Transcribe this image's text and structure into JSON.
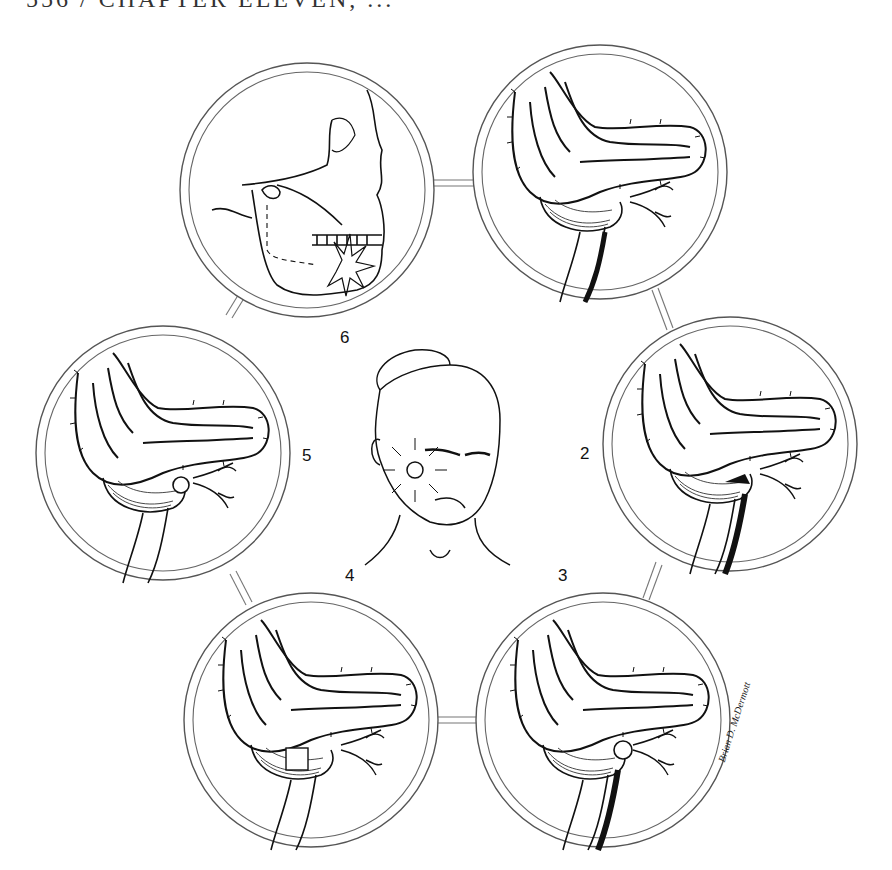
{
  "header": {
    "text": "556 / CHAPTER ELEVEN, ..."
  },
  "figure": {
    "center_panel": {
      "label": "",
      "subject": "face-with-facial-injury"
    },
    "panels": [
      {
        "number": "1",
        "label": "",
        "subject": "brainstem-cerebellum-stage-1"
      },
      {
        "number": "2",
        "label": "2",
        "subject": "brainstem-cerebellum-stage-2"
      },
      {
        "number": "3",
        "label": "3",
        "subject": "brainstem-cerebellum-stage-3"
      },
      {
        "number": "4",
        "label": "4",
        "subject": "brainstem-cerebellum-stage-4"
      },
      {
        "number": "5",
        "label": "5",
        "subject": "brainstem-cerebellum-stage-5"
      },
      {
        "number": "6",
        "label": "6",
        "subject": "skull-mandible-fracture"
      }
    ],
    "signature": "Brian D. McDermott"
  },
  "colors": {
    "line": "#222222",
    "ring": "#555555",
    "background": "#ffffff"
  }
}
